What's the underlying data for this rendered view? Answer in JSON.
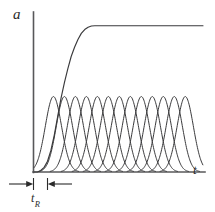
{
  "figure": {
    "background_color": "#ffffff",
    "ink_color": "#3a3a3c",
    "axis_color": "#58585a",
    "y_axis_label": "a",
    "x_axis_label": "t",
    "interval_label_base": "t",
    "interval_label_sub": "R"
  },
  "chart_data": {
    "type": "line",
    "title": "",
    "subtitle": "",
    "xlabel": "t",
    "ylabel": "a",
    "grid": false,
    "legend": null,
    "xlim": [
      0,
      100
    ],
    "ylim": [
      0,
      100
    ],
    "axis_ticks": {
      "x": [],
      "y": []
    },
    "annotations": [
      {
        "text": "tR",
        "type": "interval-dimension",
        "x_start": 0,
        "x_end": 10,
        "y": 0,
        "description": "resolution time interval marked with inward arrows below the x-axis origin"
      }
    ],
    "series": [
      {
        "name": "cumulative-sigmoid",
        "type": "line",
        "style": "solid",
        "plateau_value": 95,
        "rise_start_x": 2,
        "rise_end_x": 38,
        "x": [
          0,
          2,
          4,
          6,
          8,
          10,
          12,
          14,
          16,
          18,
          20,
          22,
          24,
          26,
          28,
          30,
          32,
          34,
          36,
          38,
          45,
          55,
          65,
          75,
          85,
          95,
          100
        ],
        "y": [
          0,
          0,
          1,
          3,
          7,
          14,
          24,
          36,
          48,
          58,
          67,
          75,
          81,
          86,
          90,
          92.5,
          94,
          94.8,
          95,
          95,
          95,
          95,
          95,
          95,
          95,
          95,
          95
        ]
      },
      {
        "name": "gaussian-pulse-01",
        "type": "line",
        "peak_x": 11.5,
        "peak_y": 49,
        "sigma": 4.8
      },
      {
        "name": "gaussian-pulse-02",
        "type": "line",
        "peak_x": 18.0,
        "peak_y": 49,
        "sigma": 4.8
      },
      {
        "name": "gaussian-pulse-03",
        "type": "line",
        "peak_x": 24.5,
        "peak_y": 49,
        "sigma": 4.8
      },
      {
        "name": "gaussian-pulse-04",
        "type": "line",
        "peak_x": 31.0,
        "peak_y": 49,
        "sigma": 4.8
      },
      {
        "name": "gaussian-pulse-05",
        "type": "line",
        "peak_x": 37.5,
        "peak_y": 49,
        "sigma": 4.8
      },
      {
        "name": "gaussian-pulse-06",
        "type": "line",
        "peak_x": 44.0,
        "peak_y": 49,
        "sigma": 4.8
      },
      {
        "name": "gaussian-pulse-07",
        "type": "line",
        "peak_x": 50.5,
        "peak_y": 49,
        "sigma": 4.8
      },
      {
        "name": "gaussian-pulse-08",
        "type": "line",
        "peak_x": 57.0,
        "peak_y": 49,
        "sigma": 4.8
      },
      {
        "name": "gaussian-pulse-09",
        "type": "line",
        "peak_x": 63.5,
        "peak_y": 49,
        "sigma": 4.8
      },
      {
        "name": "gaussian-pulse-10",
        "type": "line",
        "peak_x": 70.0,
        "peak_y": 49,
        "sigma": 4.8
      },
      {
        "name": "gaussian-pulse-11",
        "type": "line",
        "peak_x": 76.5,
        "peak_y": 49,
        "sigma": 4.8
      },
      {
        "name": "gaussian-pulse-12",
        "type": "line",
        "peak_x": 83.0,
        "peak_y": 49,
        "sigma": 4.8
      },
      {
        "name": "gaussian-pulse-13",
        "type": "line",
        "peak_x": 89.5,
        "peak_y": 49,
        "sigma": 4.8
      }
    ]
  }
}
